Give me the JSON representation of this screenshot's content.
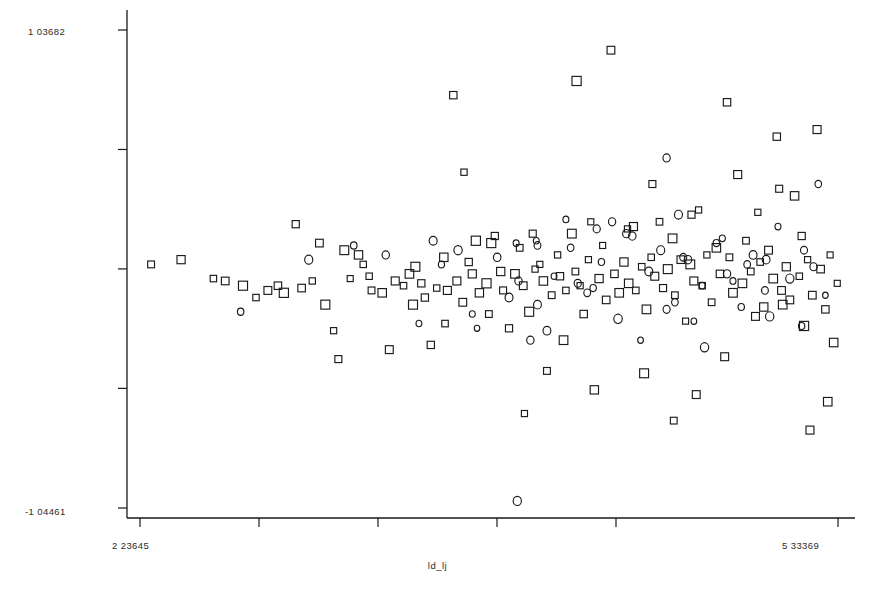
{
  "chart_data": {
    "type": "scatter",
    "title": "",
    "subtitle": "",
    "xlabel": "ld_lj",
    "ylabel": "",
    "xlim": [
      2.23645,
      5.33369
    ],
    "ylim": [
      -1.04461,
      1.03682
    ],
    "grid": false,
    "legend": null,
    "axis": {
      "x_tick_labels": [
        "2 23645",
        "5 33369"
      ],
      "y_tick_labels": [
        "1 03682",
        "-1 04461"
      ],
      "x_tick_count": 6,
      "y_tick_count": 5,
      "x_tick_values": [
        2.23645,
        2.74599,
        3.25553,
        3.76507,
        4.27461,
        5.33369
      ],
      "y_tick_values": [
        1.03682,
        0.51662,
        -0.00358,
        -0.52378,
        -1.04461
      ]
    },
    "series": [
      {
        "name": "squares",
        "marker": "square",
        "color": "#1a1a1a",
        "fill": "none",
        "points": [
          [
            2.2857,
            0.0162
          ],
          [
            2.4187,
            0.0368
          ],
          [
            2.5621,
            -0.0456
          ],
          [
            2.6146,
            -0.056
          ],
          [
            2.6935,
            -0.0766
          ],
          [
            2.7512,
            -0.1282
          ],
          [
            2.8038,
            -0.0972
          ],
          [
            2.8485,
            -0.0766
          ],
          [
            2.9274,
            0.1913
          ],
          [
            2.9536,
            -0.0869
          ],
          [
            3.001,
            -0.056
          ],
          [
            3.0325,
            0.1089
          ],
          [
            3.0588,
            -0.1591
          ],
          [
            3.0956,
            -0.2725
          ],
          [
            3.1166,
            -0.3962
          ],
          [
            3.1692,
            -0.0456
          ],
          [
            3.206,
            0.0574
          ],
          [
            3.227,
            0.0162
          ],
          [
            3.2533,
            -0.0354
          ],
          [
            3.2638,
            -0.0972
          ],
          [
            3.3111,
            -0.1076
          ],
          [
            3.3427,
            -0.355
          ],
          [
            3.369,
            -0.056
          ],
          [
            3.4058,
            -0.0766
          ],
          [
            3.4321,
            -0.0251
          ],
          [
            3.4584,
            0.0059
          ],
          [
            3.4847,
            -0.0663
          ],
          [
            3.5005,
            -0.1282
          ],
          [
            3.5268,
            -0.3344
          ],
          [
            3.5531,
            -0.0869
          ],
          [
            3.5846,
            0.0471
          ],
          [
            3.6004,
            -0.0972
          ],
          [
            3.6267,
            0.753
          ],
          [
            3.6425,
            -0.056
          ],
          [
            3.6688,
            -0.1488
          ],
          [
            3.6951,
            0.0265
          ],
          [
            3.7109,
            -0.0251
          ],
          [
            3.7267,
            0.1192
          ],
          [
            3.7424,
            -0.1076
          ],
          [
            3.774,
            -0.0663
          ],
          [
            3.795,
            0.1089
          ],
          [
            3.8108,
            0.1398
          ],
          [
            3.8371,
            -0.0148
          ],
          [
            3.8476,
            -0.0972
          ],
          [
            3.8739,
            -0.2622
          ],
          [
            3.9002,
            -0.0251
          ],
          [
            3.9213,
            0.0883
          ],
          [
            3.937,
            -0.0766
          ],
          [
            3.9633,
            -0.1901
          ],
          [
            3.9896,
            -0.0044
          ],
          [
            4.0106,
            0.0162
          ],
          [
            4.0264,
            -0.056
          ],
          [
            4.0422,
            -0.4477
          ],
          [
            4.0632,
            -0.1179
          ],
          [
            4.0895,
            0.0574
          ],
          [
            4.1,
            -0.0354
          ],
          [
            4.1263,
            -0.0972
          ],
          [
            4.1526,
            0.1501
          ],
          [
            4.1684,
            -0.0148
          ],
          [
            4.1894,
            -0.0766
          ],
          [
            4.2052,
            -0.2
          ],
          [
            4.2262,
            0.0368
          ],
          [
            4.2525,
            -0.5302
          ],
          [
            4.2735,
            -0.0456
          ],
          [
            4.2893,
            0.0986
          ],
          [
            4.305,
            -0.1385
          ],
          [
            4.3261,
            0.9489
          ],
          [
            4.3418,
            -0.0251
          ],
          [
            4.3629,
            -0.1076
          ],
          [
            4.3839,
            0.0265
          ],
          [
            4.4049,
            -0.0663
          ],
          [
            4.426,
            0.181
          ],
          [
            4.4365,
            -0.0972
          ],
          [
            4.4628,
            0.0059
          ],
          [
            4.4838,
            -0.1797
          ],
          [
            4.5048,
            0.0471
          ],
          [
            4.5206,
            -0.0354
          ],
          [
            4.5416,
            0.2016
          ],
          [
            4.5574,
            -0.0869
          ],
          [
            4.5784,
            -0.0044
          ],
          [
            4.5995,
            0.1295
          ],
          [
            4.61,
            -0.1179
          ],
          [
            4.6363,
            0.0368
          ],
          [
            4.6573,
            -0.2309
          ],
          [
            4.6783,
            0.0162
          ],
          [
            4.6941,
            -0.056
          ],
          [
            4.7151,
            0.2532
          ],
          [
            4.7309,
            -0.0766
          ],
          [
            4.7519,
            0.0574
          ],
          [
            4.773,
            -0.1488
          ],
          [
            4.794,
            0.0883
          ],
          [
            4.8098,
            -0.0251
          ],
          [
            4.8308,
            -0.3859
          ],
          [
            4.8518,
            0.0471
          ],
          [
            4.8676,
            -0.1076
          ],
          [
            4.8886,
            0.4074
          ],
          [
            4.9096,
            -0.0663
          ],
          [
            4.9254,
            0.1192
          ],
          [
            4.9465,
            -0.0148
          ],
          [
            4.9675,
            -0.2103
          ],
          [
            4.9885,
            0.0265
          ],
          [
            5.0043,
            -0.1694
          ],
          [
            5.0253,
            0.078
          ],
          [
            5.0463,
            -0.0456
          ],
          [
            5.0621,
            0.5724
          ],
          [
            5.0831,
            -0.0972
          ],
          [
            5.1042,
            0.0059
          ],
          [
            5.1199,
            -0.1385
          ],
          [
            5.141,
            0.3146
          ],
          [
            5.162,
            -0.0354
          ],
          [
            5.183,
            -0.2519
          ],
          [
            5.1988,
            0.0368
          ],
          [
            5.2198,
            -0.1179
          ],
          [
            5.2408,
            0.6033
          ],
          [
            5.2566,
            -0.0044
          ],
          [
            5.2777,
            -0.1797
          ],
          [
            5.2987,
            0.0574
          ],
          [
            5.3145,
            -0.3241
          ],
          [
            5.3303,
            -0.0663
          ],
          [
            4.1736,
            0.8149
          ],
          [
            4.8413,
            0.7221
          ],
          [
            5.0726,
            0.3455
          ],
          [
            4.6048,
            -0.6642
          ],
          [
            5.2093,
            -0.7054
          ],
          [
            3.9423,
            -0.6333
          ],
          [
            3.6741,
            0.4177
          ],
          [
            4.4733,
            -0.458
          ],
          [
            4.7046,
            -0.5508
          ],
          [
            5.2882,
            -0.5818
          ],
          [
            3.7845,
            -0.2
          ],
          [
            4.978,
            0.2429
          ],
          [
            5.1725,
            0.1398
          ],
          [
            3.4479,
            -0.1591
          ],
          [
            3.5899,
            -0.2415
          ],
          [
            4.2367,
            0.2016
          ],
          [
            4.5101,
            0.3661
          ],
          [
            2.8748,
            -0.1076
          ],
          [
            3.1429,
            0.078
          ],
          [
            4.3997,
            0.1707
          ],
          [
            4.6836,
            0.2326
          ],
          [
            5.0884,
            -0.1591
          ],
          [
            3.9791,
            0.1501
          ],
          [
            4.1158,
            -0.3138
          ]
        ]
      },
      {
        "name": "circles",
        "marker": "circle",
        "color": "#1a1a1a",
        "fill": "none",
        "points": [
          [
            2.683,
            -0.1901
          ],
          [
            2.9852,
            0.0368
          ],
          [
            3.185,
            0.0986
          ],
          [
            3.3269,
            0.0574
          ],
          [
            3.4742,
            -0.2412
          ],
          [
            3.5741,
            0.0162
          ],
          [
            3.7109,
            -0.2
          ],
          [
            3.8213,
            0.0471
          ],
          [
            3.916,
            -0.056
          ],
          [
            3.9949,
            0.1192
          ],
          [
            4.0737,
            -0.0354
          ],
          [
            4.1473,
            0.0883
          ],
          [
            4.2209,
            -0.1076
          ],
          [
            4.284,
            0.0265
          ],
          [
            4.3576,
            -0.2209
          ],
          [
            4.4207,
            0.1398
          ],
          [
            4.4943,
            -0.0148
          ],
          [
            4.5469,
            0.078
          ],
          [
            4.61,
            -0.1488
          ],
          [
            4.6678,
            0.0368
          ],
          [
            4.7309,
            -0.0766
          ],
          [
            4.794,
            0.1089
          ],
          [
            4.8413,
            -0.0251
          ],
          [
            4.9044,
            -0.1694
          ],
          [
            4.957,
            0.0574
          ],
          [
            5.0095,
            -0.0972
          ],
          [
            5.0674,
            0.181
          ],
          [
            5.1199,
            -0.0456
          ],
          [
            5.1725,
            -0.2519
          ],
          [
            5.2251,
            0.0059
          ],
          [
            5.2777,
            -0.1179
          ],
          [
            4.0001,
            0.0986
          ],
          [
            4.263,
            0.1707
          ],
          [
            4.4575,
            -0.3138
          ],
          [
            4.6468,
            0.0471
          ],
          [
            3.8739,
            -0.1282
          ],
          [
            4.0422,
            -0.2725
          ],
          [
            4.3313,
            0.2016
          ],
          [
            4.5732,
            -0.1797
          ],
          [
            4.8203,
            0.1295
          ],
          [
            5.0306,
            -0.2103
          ],
          [
            5.2461,
            0.3661
          ],
          [
            3.6478,
            0.078
          ],
          [
            4.1789,
            -0.0663
          ],
          [
            4.3944,
            0.1501
          ],
          [
            4.6941,
            -0.2309
          ],
          [
            4.9307,
            0.0162
          ],
          [
            3.9055,
            0.1089
          ],
          [
            4.5732,
            0.4796
          ],
          [
            4.7414,
            -0.3447
          ],
          [
            5.0148,
            0.0368
          ],
          [
            4.2472,
            -0.0869
          ],
          [
            4.1263,
            0.2119
          ],
          [
            3.9686,
            -0.3138
          ],
          [
            4.8676,
            -0.056
          ],
          [
            5.183,
            0.078
          ],
          [
            3.5373,
            0.1192
          ],
          [
            4.0001,
            -0.1591
          ],
          [
            4.6258,
            0.2326
          ],
          [
            3.7319,
            -0.2622
          ],
          [
            3.9107,
            -1.0137
          ]
        ]
      }
    ]
  },
  "plot": {
    "background_color": "#ffffff",
    "axis_color": "#1a1a1a",
    "marker_color": "#1a1a1a",
    "geometry": {
      "left": 127,
      "right": 855,
      "top": 10,
      "bottom": 518,
      "x_first_tick": 140,
      "x_last_tick": 838,
      "y_top_tick": 30,
      "y_bottom_tick": 508
    }
  }
}
